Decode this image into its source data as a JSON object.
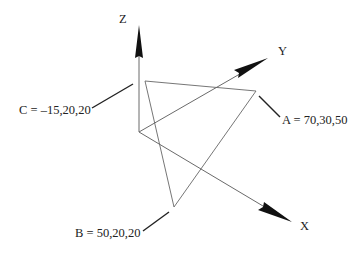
{
  "diagram": {
    "type": "3d-coordinate-triangle",
    "axes": [
      {
        "name": "z",
        "label": "Z",
        "origin": [
          139,
          132
        ],
        "tip": [
          139,
          25
        ]
      },
      {
        "name": "y",
        "label": "Y",
        "origin": [
          139,
          132
        ],
        "tip": [
          268,
          58
        ]
      },
      {
        "name": "x",
        "label": "X",
        "origin": [
          139,
          132
        ],
        "tip": [
          292,
          222
        ]
      }
    ],
    "points": [
      {
        "id": "A",
        "label": "A = 70,30,50",
        "coords": [
          70,
          30,
          50
        ],
        "screen": [
          256,
          91
        ]
      },
      {
        "id": "B",
        "label": "B = 50,20,20",
        "coords": [
          50,
          20,
          20
        ],
        "screen": [
          174,
          207
        ]
      },
      {
        "id": "C",
        "label": "C = –15,20,20",
        "coords": [
          -15,
          20,
          20
        ],
        "screen": [
          145,
          81
        ]
      }
    ],
    "colors": {
      "axis_line": "#555555",
      "triangle_line": "#555555",
      "arrowhead": "#111111",
      "leader_line": "#222222",
      "text": "#222222",
      "background": "#ffffff"
    }
  }
}
